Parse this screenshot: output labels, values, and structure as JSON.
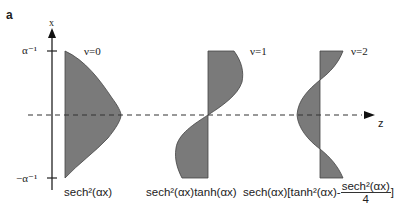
{
  "panel_label": "a",
  "axes": {
    "vertical_axis_label": "x",
    "horizontal_axis_label": "z",
    "top_tick_label": "α⁻¹",
    "bottom_tick_label": "−α⁻¹"
  },
  "modes": [
    {
      "nu_label": "ν=0",
      "function_label": "sech²(αx)"
    },
    {
      "nu_label": "ν=1",
      "function_label": "sech²(αx)tanh(αx)"
    },
    {
      "nu_label": "ν=2",
      "function_label_prefix": "sech(αx)[tanh²(αx)-",
      "fraction_numerator": "sech²(αx)",
      "fraction_denominator": "4",
      "function_label_suffix": "]"
    }
  ],
  "colors": {
    "fill": "#7a7a7a",
    "line": "#222222"
  }
}
